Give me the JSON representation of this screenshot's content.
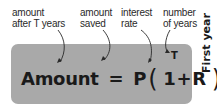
{
  "annotations": [
    {
      "id": "amount-after",
      "line1": "amount",
      "line2": "after T years"
    },
    {
      "id": "amount-saved",
      "line1": "amount",
      "line2": "saved"
    },
    {
      "id": "interest-rate",
      "line1": "interest",
      "line2": "rate"
    },
    {
      "id": "number-of-years",
      "line1": "number",
      "line2": "of years"
    }
  ],
  "formula": {
    "lhs": "Amount",
    "eq": "=",
    "p": "P",
    "open_paren": "(",
    "one": "1",
    "plus": "+",
    "r": "R",
    "close_paren": ")",
    "exponent": "T"
  },
  "side_label": "First year",
  "colors": {
    "box": "#a9a9a9",
    "text": "#1a1a1a"
  }
}
